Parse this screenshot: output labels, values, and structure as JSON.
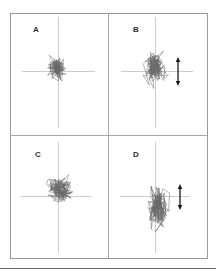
{
  "figure": {
    "frame": {
      "x": 10,
      "y": 13,
      "w": 197,
      "h": 245,
      "color": "#9a9a9a"
    },
    "dividers": {
      "vx": 108,
      "hy": 135,
      "color": "#a8a8a8"
    },
    "bottom_rule": {
      "y": 268,
      "color": "#6e6e6e"
    },
    "crosshair_color": "#c2c2c2",
    "trace_color": "#6a6a6a",
    "arrow_color": "#1a1a1a"
  },
  "chart_data": [
    {
      "type": "line",
      "title": "A",
      "description": "Center-of-pressure stabilogram trace, compact and roughly isotropic sway",
      "center": [
        58,
        71
      ],
      "crosshair": {
        "h": [
          22,
          95
        ],
        "v": [
          17,
          128
        ]
      },
      "extent": {
        "x": [
          43,
          72
        ],
        "y": [
          51,
          86
        ]
      },
      "sway_ml": 29,
      "sway_ap": 35,
      "arrow": null,
      "xlabel": "",
      "ylabel": "",
      "grid": false,
      "legend": null
    },
    {
      "type": "line",
      "title": "B",
      "description": "Stabilogram trace with increased anterior-posterior sway",
      "center": [
        155,
        71
      ],
      "crosshair": {
        "h": [
          121,
          193
        ],
        "v": [
          17,
          128
        ]
      },
      "extent": {
        "x": [
          138,
          172
        ],
        "y": [
          40,
          95
        ]
      },
      "sway_ml": 34,
      "sway_ap": 55,
      "arrow": {
        "direction": "vertical-double",
        "x": 178,
        "y": [
          57,
          86
        ]
      },
      "xlabel": "",
      "ylabel": "",
      "grid": false,
      "legend": null
    },
    {
      "type": "line",
      "title": "C",
      "description": "Stabilogram trace with wider medio-lateral sway",
      "center": [
        58,
        196
      ],
      "crosshair": {
        "h": [
          20,
          92
        ],
        "v": [
          142,
          253
        ]
      },
      "extent": {
        "x": [
          38,
          81
        ],
        "y": [
          168,
          211
        ]
      },
      "sway_ml": 43,
      "sway_ap": 43,
      "arrow": null,
      "xlabel": "",
      "ylabel": "",
      "grid": false,
      "legend": null
    },
    {
      "type": "line",
      "title": "D",
      "description": "Stabilogram trace with large anterior-posterior sway",
      "center": [
        155,
        196
      ],
      "crosshair": {
        "h": [
          120,
          190
        ],
        "v": [
          142,
          253
        ]
      },
      "extent": {
        "x": [
          143,
          174
        ],
        "y": [
          168,
          245
        ]
      },
      "sway_ml": 31,
      "sway_ap": 77,
      "arrow": {
        "direction": "vertical-double",
        "x": 180,
        "y": [
          184,
          210
        ]
      },
      "xlabel": "",
      "ylabel": "",
      "grid": false,
      "legend": null
    }
  ],
  "panels": [
    {
      "label": "A",
      "label_pos": [
        33,
        32
      ]
    },
    {
      "label": "B",
      "label_pos": [
        133,
        32
      ]
    },
    {
      "label": "C",
      "label_pos": [
        35,
        157
      ]
    },
    {
      "label": "D",
      "label_pos": [
        133,
        157
      ]
    }
  ]
}
